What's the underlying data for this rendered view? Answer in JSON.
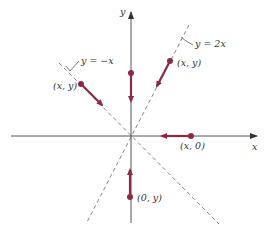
{
  "diagram": {
    "type": "coordinate-plane-vectors",
    "axes": {
      "x_label": "x",
      "y_label": "y",
      "color": "#555555"
    },
    "lines": [
      {
        "name": "line-y-neg-x",
        "label": "y = −x",
        "style": "dashed"
      },
      {
        "name": "line-y-2x",
        "label": "y = 2x",
        "style": "dashed"
      }
    ],
    "vectors": [
      {
        "name": "vector-on-neg-x-line",
        "point_label": "(x, y)",
        "direction": "toward origin"
      },
      {
        "name": "vector-on-2x-line",
        "point_label": "(x, y)",
        "direction": "toward origin"
      },
      {
        "name": "vector-on-x-axis",
        "point_label": "(x, 0)",
        "direction": "toward origin"
      },
      {
        "name": "vector-on-pos-y-axis",
        "point_label": "",
        "direction": "toward origin"
      },
      {
        "name": "vector-on-neg-y-axis",
        "point_label": "(0, y)",
        "direction": "toward origin"
      }
    ],
    "colors": {
      "vector": "#8b2a45",
      "axis": "#555555",
      "dashed": "#777777"
    }
  }
}
